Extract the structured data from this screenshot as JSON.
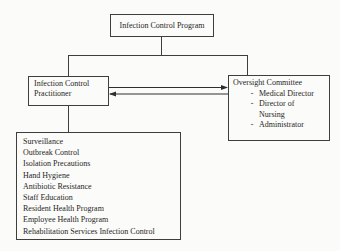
{
  "diagram": {
    "title_box": {
      "label": "Infection Control Program"
    },
    "practitioner_box": {
      "label": "Infection Control Practitioner"
    },
    "oversight_box": {
      "title": "Oversight Committee",
      "bullet": "-",
      "members": [
        "Medical Director",
        "Director of Nursing",
        "Administrator"
      ]
    },
    "programs_box": {
      "items": [
        "Surveillance",
        "Outbreak Control",
        "Isolation Precautions",
        "Hand Hygiene",
        "Antibiotic Resistance",
        "Staff Education",
        "Resident Health Program",
        "Employee Health Program",
        "Rehabilitation Services Infection Control"
      ]
    },
    "relations": {
      "practitioner_oversight": "two-way-arrows"
    },
    "colors": {
      "line": "#3e3e3e",
      "text": "#1f1f1f",
      "background": "#fbfbf9"
    }
  }
}
